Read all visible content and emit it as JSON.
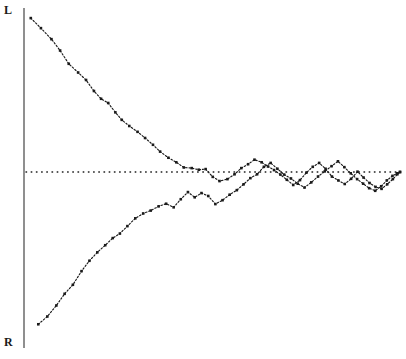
{
  "chart_data": {
    "type": "line",
    "title": "",
    "subtitle": "",
    "xlabel": "",
    "ylabel": "",
    "xlim": [
      0,
      100
    ],
    "ylim": [
      0,
      100
    ],
    "grid": false,
    "legend_position": "none",
    "annotations": [
      {
        "name": "axis-top-label",
        "text": "L",
        "x": 4,
        "y": 10,
        "meaning": "Left / upper extreme of the vertical scale"
      },
      {
        "name": "axis-bottom-label",
        "text": "R",
        "x": 4,
        "y": 343,
        "meaning": "Right / lower extreme of the vertical scale"
      }
    ],
    "reference_line": {
      "name": "midpoint-reference",
      "orientation": "horizontal",
      "y": 50,
      "style": "dotted",
      "color": "#1a1a1a"
    },
    "axis": {
      "vertical_axis_x": 0,
      "color": "#333333",
      "style": "solid"
    },
    "series": [
      {
        "name": "Upper curve (converging from L)",
        "style": "dotted-with-markers",
        "color": "#1a1a1a",
        "marker": "square",
        "x": [
          1.8,
          4.5,
          7.3,
          9.6,
          11.9,
          14.4,
          16.5,
          18.6,
          20.5,
          22.4,
          24.3,
          26.0,
          28.0,
          30.2,
          32.2,
          34.3,
          36.2,
          38.4,
          40.5,
          42.5,
          44.6,
          46.5,
          48.3,
          50.2,
          52.0,
          54.1,
          56.0,
          57.8,
          59.6,
          61.3,
          63.2,
          64.9,
          66.5,
          68.2,
          69.9,
          71.6,
          73.4,
          75.1,
          76.8,
          78.5,
          80.2,
          81.9,
          83.6,
          85.3,
          87.0,
          88.7,
          90.3,
          91.9,
          93.5,
          95.1,
          96.6,
          98.1,
          99.3,
          100.0
        ],
        "y": [
          97.5,
          94.4,
          91.0,
          87.5,
          83.4,
          80.7,
          78.4,
          75.0,
          72.6,
          71.3,
          68.4,
          66.1,
          64.2,
          62.4,
          60.5,
          58.4,
          56.3,
          54.4,
          53.0,
          51.4,
          51.2,
          50.7,
          50.9,
          48.5,
          47.2,
          47.8,
          49.3,
          51.2,
          52.4,
          53.8,
          53.0,
          51.7,
          50.6,
          49.2,
          47.6,
          46.0,
          47.5,
          49.8,
          51.6,
          52.8,
          51.0,
          48.6,
          47.4,
          46.3,
          47.9,
          50.1,
          48.3,
          46.6,
          45.4,
          44.8,
          46.2,
          47.8,
          49.3,
          50.0
        ]
      },
      {
        "name": "Lower curve (converging from R)",
        "style": "dotted-with-markers",
        "color": "#1a1a1a",
        "marker": "square",
        "x": [
          3.8,
          6.2,
          8.6,
          10.8,
          13.0,
          15.3,
          17.4,
          19.5,
          21.6,
          23.6,
          25.5,
          27.5,
          29.6,
          31.7,
          33.7,
          35.8,
          37.8,
          39.8,
          41.7,
          43.6,
          45.4,
          47.2,
          49.0,
          50.9,
          52.8,
          54.7,
          56.6,
          58.4,
          60.2,
          62.0,
          63.8,
          65.6,
          67.4,
          69.2,
          71.0,
          72.8,
          74.6,
          76.4,
          78.2,
          80.0,
          81.8,
          83.5,
          85.2,
          86.9,
          88.6,
          90.2,
          91.8,
          93.4,
          95.0,
          96.5,
          98.0,
          99.2,
          100.0
        ],
        "y": [
          3.0,
          5.4,
          8.8,
          12.4,
          15.2,
          19.4,
          22.6,
          25.2,
          27.4,
          29.6,
          31.0,
          33.3,
          35.7,
          37.2,
          38.1,
          39.4,
          40.2,
          39.1,
          41.6,
          43.8,
          42.2,
          43.5,
          42.6,
          40.1,
          41.3,
          43.0,
          44.4,
          46.2,
          48.1,
          49.3,
          51.6,
          52.8,
          51.0,
          49.2,
          48.0,
          46.4,
          45.2,
          46.8,
          48.6,
          50.2,
          51.8,
          53.3,
          51.5,
          49.6,
          47.8,
          46.4,
          45.0,
          44.2,
          45.6,
          47.4,
          48.8,
          49.6,
          50.0
        ]
      }
    ]
  },
  "labels": {
    "top": "L",
    "bottom": "R"
  }
}
